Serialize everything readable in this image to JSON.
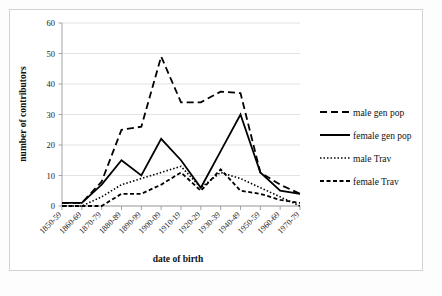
{
  "figure": {
    "background": "#ffffff",
    "frame_color": "#d2d2d2"
  },
  "chart_data": {
    "type": "line",
    "title": "",
    "xlabel": "date of birth",
    "ylabel": "number of contributors",
    "categories": [
      "1850-59",
      "1860-69",
      "1870-79",
      "1880-89",
      "1890-99",
      "1900-09",
      "1910-19",
      "1920-29",
      "1930-39",
      "1940-49",
      "1950-59",
      "1960-69",
      "1970-79"
    ],
    "ylim": [
      0,
      60
    ],
    "yticks": [
      0,
      10,
      20,
      30,
      40,
      50,
      60
    ],
    "grid": true,
    "legend_position": "right",
    "series": [
      {
        "name": "male gen pop",
        "style": "long-dash",
        "dasharray": "7,4",
        "width": 1.8,
        "color": "#000000",
        "values": [
          1,
          1,
          8,
          25,
          26,
          49,
          34,
          34,
          37.5,
          37,
          11,
          7,
          4
        ]
      },
      {
        "name": "female gen pop",
        "style": "solid",
        "dasharray": "none",
        "width": 1.8,
        "color": "#000000",
        "values": [
          1,
          1,
          7,
          15,
          10,
          22,
          15,
          6,
          18,
          30,
          11,
          5,
          4
        ]
      },
      {
        "name": "male Trav",
        "style": "dotted",
        "dasharray": "1.5,2",
        "width": 1.6,
        "color": "#000000",
        "values": [
          0,
          0,
          3,
          7,
          9,
          11,
          13,
          6,
          11,
          9,
          6,
          3,
          0
        ]
      },
      {
        "name": "female Trav",
        "style": "short-dash",
        "dasharray": "4,2.5",
        "width": 1.8,
        "color": "#000000",
        "values": [
          0,
          0,
          0,
          4,
          4,
          7,
          11,
          5,
          12,
          5,
          4,
          2,
          1
        ]
      }
    ]
  },
  "legend": {
    "items": [
      {
        "label": "male gen pop",
        "dasharray": "7,4",
        "width": 1.8
      },
      {
        "label": "female gen pop",
        "dasharray": "none",
        "width": 2.0
      },
      {
        "label": "male Trav",
        "dasharray": "1.5,2",
        "width": 1.6
      },
      {
        "label": "female Trav",
        "dasharray": "4,2.5",
        "width": 1.8
      }
    ]
  },
  "axes": {
    "y_tick_labels": [
      "0",
      "10",
      "20",
      "30",
      "40",
      "50",
      "60"
    ],
    "x_tick_labels": [
      "1850-59",
      "1860-69",
      "1870-79",
      "1880-89",
      "1890-99",
      "1900-09",
      "1910-19",
      "1920-29",
      "1930-39",
      "1940-49",
      "1950-59",
      "1960-69",
      "1970-79"
    ]
  }
}
